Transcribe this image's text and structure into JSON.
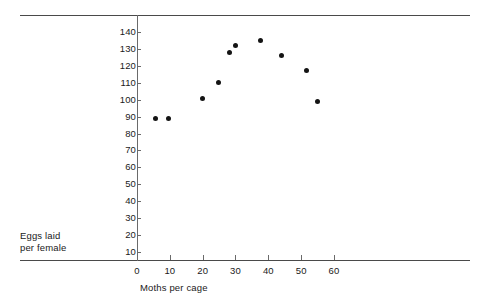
{
  "chart_data": {
    "type": "scatter",
    "title": "",
    "xlabel": "Moths per cage",
    "ylabel": "Eggs laid per female",
    "ylabel_lines": [
      "Eggs laid",
      "per female"
    ],
    "xlim": [
      0,
      66
    ],
    "ylim": [
      0,
      146
    ],
    "xticks": [
      0,
      10,
      20,
      30,
      40,
      50,
      60
    ],
    "xtick_labels": [
      "0",
      "10",
      "20",
      "30",
      "40",
      "50",
      "60"
    ],
    "yticks": [
      10,
      20,
      30,
      40,
      50,
      60,
      70,
      80,
      90,
      100,
      110,
      120,
      130,
      140
    ],
    "ytick_labels": [
      "10",
      "20",
      "30",
      "40",
      "50",
      "60",
      "70",
      "80",
      "90",
      "100",
      "110",
      "120",
      "130",
      "140"
    ],
    "grid": false,
    "legend": null,
    "marker": "filled-circle",
    "marker_color": "#141414",
    "points": [
      {
        "x": 5.7,
        "y": 89
      },
      {
        "x": 9.5,
        "y": 89
      },
      {
        "x": 19.9,
        "y": 101
      },
      {
        "x": 24.8,
        "y": 110
      },
      {
        "x": 28.3,
        "y": 128
      },
      {
        "x": 29.9,
        "y": 132
      },
      {
        "x": 37.7,
        "y": 135
      },
      {
        "x": 43.9,
        "y": 126
      },
      {
        "x": 51.5,
        "y": 117
      },
      {
        "x": 55.1,
        "y": 99
      }
    ],
    "x": [
      5.7,
      9.5,
      19.9,
      24.8,
      28.3,
      29.9,
      37.7,
      43.9,
      51.5,
      55.1
    ],
    "values": [
      89,
      89,
      101,
      110,
      128,
      132,
      135,
      126,
      117,
      99
    ],
    "axis_color": "#4a4a4a",
    "background": "#ffffff"
  }
}
